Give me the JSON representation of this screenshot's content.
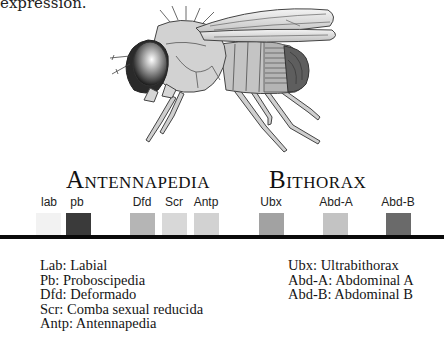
{
  "fragment_text": "expression.",
  "illustration": {
    "subject": "fruit-fly-drosophila",
    "alt": "Drosophila side view"
  },
  "complexes": [
    {
      "name": "Antennapedia",
      "first": "A",
      "rest": "NTENNAPEDIA",
      "x": 66
    },
    {
      "name": "Bithorax",
      "first": "B",
      "rest": "ITHORAX",
      "x": 269
    }
  ],
  "genes": [
    {
      "label": "lab",
      "center": 49,
      "box_left": 36,
      "color": "#f2f2f2"
    },
    {
      "label": "pb",
      "center": 77,
      "box_left": 66,
      "color": "#3a3a3a"
    },
    {
      "label": "Dfd",
      "center": 142,
      "box_left": 130,
      "color": "#b5b5b5"
    },
    {
      "label": "Scr",
      "center": 174,
      "box_left": 162,
      "color": "#d8d8d8"
    },
    {
      "label": "Antp",
      "center": 206,
      "box_left": 194,
      "color": "#d2d2d2"
    },
    {
      "label": "Ubx",
      "center": 271,
      "box_left": 259,
      "color": "#a2a2a2"
    },
    {
      "label": "Abd-A",
      "center": 336,
      "box_left": 323,
      "color": "#c3c3c3"
    },
    {
      "label": "Abd-B",
      "center": 398,
      "box_left": 386,
      "color": "#6a6a6a"
    }
  ],
  "legend_left": [
    "Lab: Labial",
    "Pb: Proboscipedia",
    "Dfd: Deformado",
    "Scr: Comba sexual reducida",
    "Antp: Antennapedia"
  ],
  "legend_right": [
    "Ubx: Ultrabithorax",
    "Abd-A: Abdominal A",
    "Abd-B: Abdominal B"
  ]
}
